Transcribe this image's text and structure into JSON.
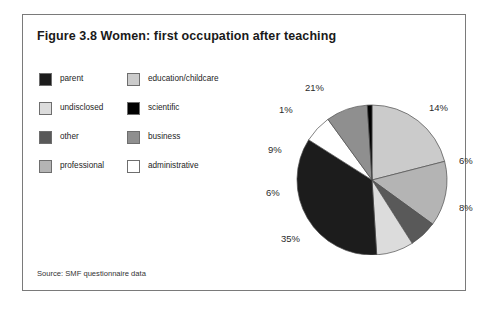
{
  "figure": {
    "title": "Figure 3.8 Women: first occupation after teaching",
    "source": "Source: SMF questionnaire data"
  },
  "legend": {
    "column_1": [
      {
        "label": "parent",
        "color": "#1c1c1c"
      },
      {
        "label": "undisclosed",
        "color": "#dcdcdc"
      },
      {
        "label": "other",
        "color": "#595959"
      },
      {
        "label": "professional",
        "color": "#b4b4b4"
      }
    ],
    "column_2": [
      {
        "label": "education/childcare",
        "color": "#cbcbcb"
      },
      {
        "label": "scientific",
        "color": "#000000"
      },
      {
        "label": "business",
        "color": "#8f8f8f"
      },
      {
        "label": "administrative",
        "color": "#ffffff"
      }
    ]
  },
  "chart_data": {
    "type": "pie",
    "title": "Figure 3.8 Women: first occupation after teaching",
    "xlabel": "",
    "ylabel": "",
    "legend_position": "left",
    "grid": false,
    "start_angle_deg": 0,
    "direction": "clockwise",
    "categories": [
      "education/childcare",
      "professional",
      "other",
      "undisclosed",
      "parent",
      "administrative",
      "business",
      "scientific"
    ],
    "values": [
      21,
      14,
      6,
      8,
      35,
      6,
      9,
      1
    ],
    "colors": [
      "#cbcbcb",
      "#b4b4b4",
      "#595959",
      "#dcdcdc",
      "#1c1c1c",
      "#ffffff",
      "#8f8f8f",
      "#000000"
    ],
    "data_labels": [
      "21%",
      "14%",
      "6%",
      "8%",
      "35%",
      "6%",
      "9%",
      "1%"
    ],
    "units": "percent",
    "total": 100
  },
  "pie_labels": [
    {
      "text": "21%",
      "x": 72,
      "y": 22
    },
    {
      "text": "14%",
      "x": 196,
      "y": 42
    },
    {
      "text": "6%",
      "x": 226,
      "y": 95
    },
    {
      "text": "8%",
      "x": 226,
      "y": 142
    },
    {
      "text": "35%",
      "x": 48,
      "y": 173
    },
    {
      "text": "6%",
      "x": 33,
      "y": 127
    },
    {
      "text": "9%",
      "x": 35,
      "y": 84
    },
    {
      "text": "1%",
      "x": 46,
      "y": 44
    }
  ]
}
